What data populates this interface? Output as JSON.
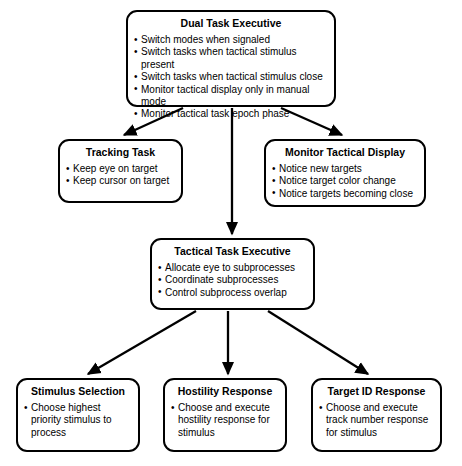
{
  "diagram": {
    "type": "hierarchical-flowchart",
    "background_color": "#ffffff",
    "line_color": "#000000",
    "nodes": [
      {
        "id": "dual-task-executive",
        "title": "Dual Task Executive",
        "bullets": [
          "Switch modes when signaled",
          "Switch tasks when tactical stimulus present",
          "Switch tasks when tactical stimulus close",
          "Monitor tactical display only in manual mode",
          "Monitor tactical task epoch phase"
        ]
      },
      {
        "id": "tracking-task",
        "title": "Tracking Task",
        "bullets": [
          "Keep eye on target",
          "Keep cursor on target"
        ]
      },
      {
        "id": "monitor-tactical-display",
        "title": "Monitor Tactical Display",
        "bullets": [
          "Notice new targets",
          "Notice target color change",
          "Notice targets becoming close"
        ]
      },
      {
        "id": "tactical-task-executive",
        "title": "Tactical Task Executive",
        "bullets": [
          "Allocate eye to subprocesses",
          "Coordinate subprocesses",
          "Control subprocess overlap"
        ]
      },
      {
        "id": "stimulus-selection",
        "title": "Stimulus Selection",
        "bullets": [
          "Choose highest priority stimulus to process"
        ]
      },
      {
        "id": "hostility-response",
        "title": "Hostility Response",
        "bullets": [
          "Choose and execute hostility response for stimulus"
        ]
      },
      {
        "id": "target-id-response",
        "title": "Target ID Response",
        "bullets": [
          "Choose and execute track number response for stimulus"
        ]
      }
    ],
    "edges": [
      {
        "from": "dual-task-executive",
        "to": "tracking-task"
      },
      {
        "from": "dual-task-executive",
        "to": "tactical-task-executive"
      },
      {
        "from": "dual-task-executive",
        "to": "monitor-tactical-display"
      },
      {
        "from": "tactical-task-executive",
        "to": "stimulus-selection"
      },
      {
        "from": "tactical-task-executive",
        "to": "hostility-response"
      },
      {
        "from": "tactical-task-executive",
        "to": "target-id-response"
      }
    ]
  }
}
